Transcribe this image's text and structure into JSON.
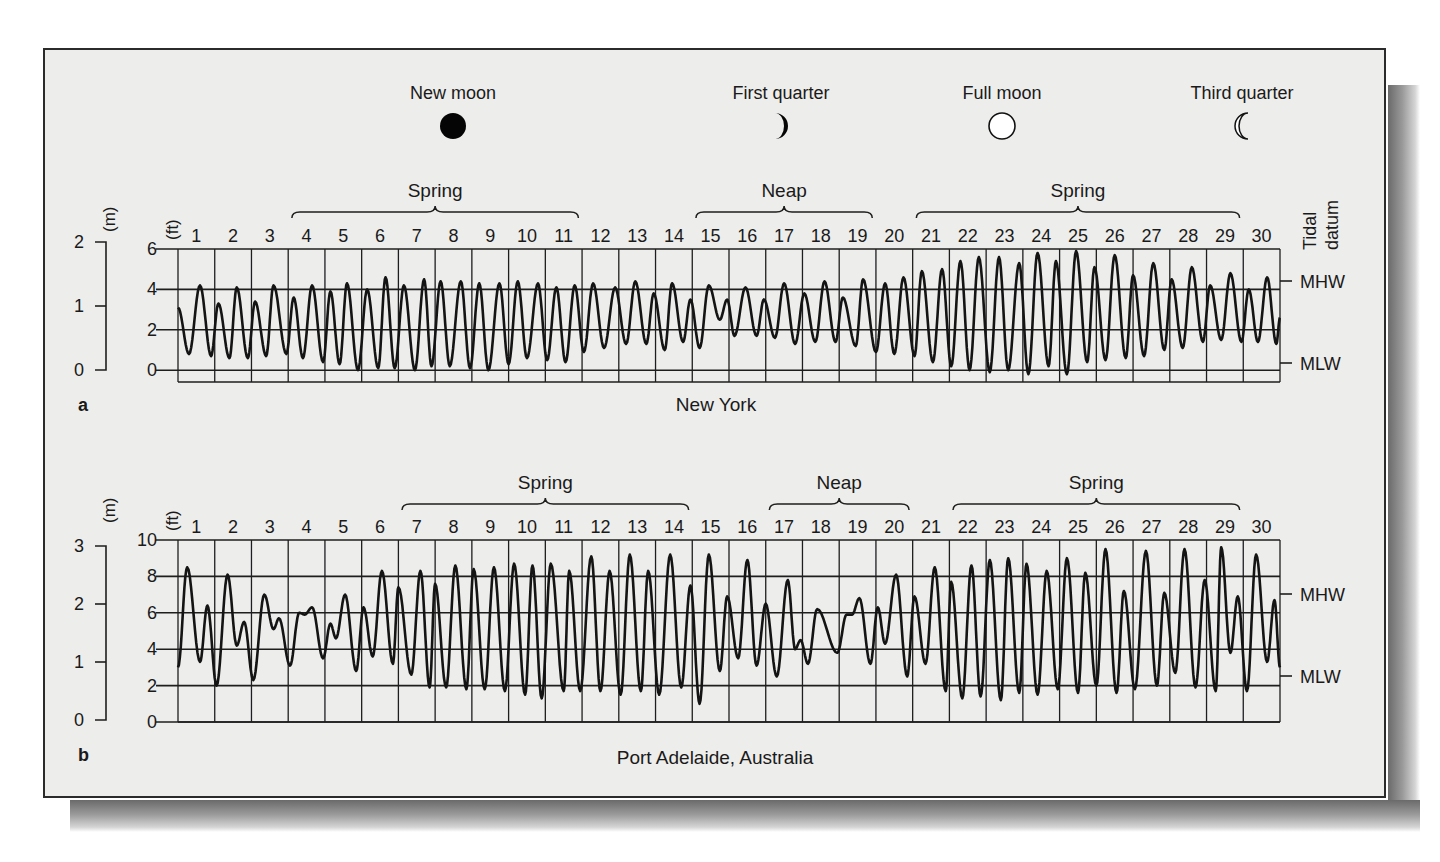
{
  "moon_phases": [
    {
      "label": "New moon",
      "icon": "new-moon-icon",
      "x": 453
    },
    {
      "label": "First quarter",
      "icon": "first-quarter-moon-icon",
      "x": 781
    },
    {
      "label": "Full moon",
      "icon": "full-moon-icon",
      "x": 1002
    },
    {
      "label": "Third quarter",
      "icon": "third-quarter-moon-icon",
      "x": 1242
    }
  ],
  "tidal_datum_label": [
    "Tidal",
    "datum"
  ],
  "chart_data": [
    {
      "type": "line",
      "panel_label": "a",
      "title": "New York",
      "xlabel": "Day of month",
      "ylabel_left_m": "(m)",
      "ylabel_left_ft": "(ft)",
      "x_ticks": [
        "1",
        "2",
        "3",
        "4",
        "5",
        "6",
        "7",
        "8",
        "9",
        "10",
        "11",
        "12",
        "13",
        "14",
        "15",
        "16",
        "17",
        "18",
        "19",
        "20",
        "21",
        "22",
        "23",
        "24",
        "25",
        "26",
        "27",
        "28",
        "29",
        "30"
      ],
      "y_ticks_ft": [
        0,
        2,
        4,
        6
      ],
      "y_ticks_m": [
        0,
        1,
        2
      ],
      "ylim_ft": [
        -0.6,
        6
      ],
      "grid": true,
      "datum_markers": [
        {
          "label": "MHW",
          "ft": 4.4
        },
        {
          "label": "MLW",
          "ft": 0.3
        }
      ],
      "periods": [
        {
          "label": "Spring",
          "from_day": 4,
          "to_day": 11
        },
        {
          "label": "Neap",
          "from_day": 15,
          "to_day": 19
        },
        {
          "label": "Spring",
          "from_day": 21,
          "to_day": 29
        }
      ],
      "series": [
        {
          "name": "Water level (ft)",
          "extremes": [
            [
              0.0,
              3.1
            ],
            [
              0.3,
              0.8
            ],
            [
              0.6,
              4.2
            ],
            [
              0.9,
              0.7
            ],
            [
              1.1,
              3.3
            ],
            [
              1.4,
              0.6
            ],
            [
              1.6,
              4.1
            ],
            [
              1.9,
              0.6
            ],
            [
              2.1,
              3.4
            ],
            [
              2.4,
              0.7
            ],
            [
              2.6,
              4.2
            ],
            [
              2.95,
              0.8
            ],
            [
              3.15,
              3.6
            ],
            [
              3.4,
              0.6
            ],
            [
              3.65,
              4.2
            ],
            [
              3.95,
              0.4
            ],
            [
              4.15,
              3.9
            ],
            [
              4.4,
              0.3
            ],
            [
              4.6,
              4.3
            ],
            [
              4.9,
              0.0
            ],
            [
              5.15,
              4.0
            ],
            [
              5.45,
              0.1
            ],
            [
              5.65,
              4.6
            ],
            [
              5.9,
              0.1
            ],
            [
              6.15,
              4.2
            ],
            [
              6.45,
              0.0
            ],
            [
              6.7,
              4.5
            ],
            [
              6.9,
              0.2
            ],
            [
              7.15,
              4.4
            ],
            [
              7.4,
              0.2
            ],
            [
              7.7,
              4.4
            ],
            [
              7.95,
              0.1
            ],
            [
              8.2,
              4.3
            ],
            [
              8.45,
              0.0
            ],
            [
              8.75,
              4.3
            ],
            [
              9.0,
              0.3
            ],
            [
              9.25,
              4.4
            ],
            [
              9.5,
              0.6
            ],
            [
              9.8,
              4.3
            ],
            [
              10.05,
              0.5
            ],
            [
              10.3,
              4.1
            ],
            [
              10.55,
              0.4
            ],
            [
              10.8,
              4.2
            ],
            [
              11.05,
              0.9
            ],
            [
              11.3,
              4.3
            ],
            [
              11.6,
              1.1
            ],
            [
              11.9,
              4.1
            ],
            [
              12.2,
              1.3
            ],
            [
              12.45,
              4.4
            ],
            [
              12.75,
              1.3
            ],
            [
              12.95,
              3.8
            ],
            [
              13.25,
              1.0
            ],
            [
              13.45,
              4.3
            ],
            [
              13.75,
              1.4
            ],
            [
              13.95,
              3.5
            ],
            [
              14.2,
              1.1
            ],
            [
              14.45,
              4.2
            ],
            [
              14.75,
              2.5
            ],
            [
              14.95,
              3.5
            ],
            [
              15.15,
              1.7
            ],
            [
              15.45,
              4.1
            ],
            [
              15.75,
              1.7
            ],
            [
              15.95,
              3.5
            ],
            [
              16.25,
              1.6
            ],
            [
              16.5,
              4.3
            ],
            [
              16.8,
              1.3
            ],
            [
              17.05,
              3.8
            ],
            [
              17.35,
              1.4
            ],
            [
              17.6,
              4.4
            ],
            [
              17.9,
              1.4
            ],
            [
              18.1,
              3.6
            ],
            [
              18.45,
              1.2
            ],
            [
              18.65,
              4.5
            ],
            [
              19.0,
              0.9
            ],
            [
              19.25,
              4.3
            ],
            [
              19.5,
              0.8
            ],
            [
              19.75,
              4.6
            ],
            [
              20.05,
              0.7
            ],
            [
              20.25,
              4.9
            ],
            [
              20.55,
              0.4
            ],
            [
              20.8,
              5.0
            ],
            [
              21.05,
              0.2
            ],
            [
              21.3,
              5.4
            ],
            [
              21.55,
              0.0
            ],
            [
              21.8,
              5.6
            ],
            [
              22.1,
              -0.1
            ],
            [
              22.35,
              5.6
            ],
            [
              22.6,
              0.0
            ],
            [
              22.9,
              5.3
            ],
            [
              23.15,
              -0.2
            ],
            [
              23.4,
              5.8
            ],
            [
              23.7,
              0.2
            ],
            [
              23.9,
              5.4
            ],
            [
              24.2,
              -0.2
            ],
            [
              24.45,
              5.9
            ],
            [
              24.75,
              0.4
            ],
            [
              24.95,
              5.1
            ],
            [
              25.25,
              0.5
            ],
            [
              25.5,
              5.7
            ],
            [
              25.8,
              0.6
            ],
            [
              26.0,
              4.7
            ],
            [
              26.3,
              0.7
            ],
            [
              26.55,
              5.3
            ],
            [
              26.85,
              1.0
            ],
            [
              27.05,
              4.5
            ],
            [
              27.35,
              1.1
            ],
            [
              27.6,
              5.1
            ],
            [
              27.9,
              1.4
            ],
            [
              28.1,
              4.2
            ],
            [
              28.4,
              1.5
            ],
            [
              28.65,
              4.8
            ],
            [
              28.95,
              1.4
            ],
            [
              29.15,
              4.0
            ],
            [
              29.4,
              1.4
            ],
            [
              29.65,
              4.6
            ],
            [
              29.9,
              1.3
            ],
            [
              30.0,
              2.6
            ]
          ]
        }
      ]
    },
    {
      "type": "line",
      "panel_label": "b",
      "title": "Port Adelaide, Australia",
      "xlabel": "Day of month",
      "ylabel_left_m": "(m)",
      "ylabel_left_ft": "(ft)",
      "x_ticks": [
        "1",
        "2",
        "3",
        "4",
        "5",
        "6",
        "7",
        "8",
        "9",
        "10",
        "11",
        "12",
        "13",
        "14",
        "15",
        "16",
        "17",
        "18",
        "19",
        "20",
        "21",
        "22",
        "23",
        "24",
        "25",
        "26",
        "27",
        "28",
        "29",
        "30"
      ],
      "y_ticks_ft": [
        0,
        2,
        4,
        6,
        8,
        10
      ],
      "y_ticks_m": [
        0,
        1,
        2,
        3
      ],
      "ylim_ft": [
        0,
        10
      ],
      "grid": true,
      "datum_markers": [
        {
          "label": "MHW",
          "ft": 7.0
        },
        {
          "label": "MLW",
          "ft": 2.6
        }
      ],
      "periods": [
        {
          "label": "Spring",
          "from_day": 7,
          "to_day": 14
        },
        {
          "label": "Neap",
          "from_day": 17,
          "to_day": 20
        },
        {
          "label": "Spring",
          "from_day": 22,
          "to_day": 29
        }
      ],
      "series": [
        {
          "name": "Water level (ft)",
          "extremes": [
            [
              0.0,
              3.0
            ],
            [
              0.25,
              8.5
            ],
            [
              0.6,
              3.3
            ],
            [
              0.8,
              6.4
            ],
            [
              1.05,
              2.0
            ],
            [
              1.35,
              8.1
            ],
            [
              1.6,
              4.2
            ],
            [
              1.8,
              5.5
            ],
            [
              2.05,
              2.3
            ],
            [
              2.35,
              7.0
            ],
            [
              2.6,
              5.1
            ],
            [
              2.75,
              5.7
            ],
            [
              3.05,
              3.1
            ],
            [
              3.3,
              6.0
            ],
            [
              3.45,
              5.9
            ],
            [
              3.65,
              6.3
            ],
            [
              3.95,
              3.5
            ],
            [
              4.15,
              5.4
            ],
            [
              4.3,
              4.6
            ],
            [
              4.55,
              7.0
            ],
            [
              4.85,
              2.8
            ],
            [
              5.05,
              6.3
            ],
            [
              5.3,
              3.6
            ],
            [
              5.55,
              8.3
            ],
            [
              5.85,
              3.2
            ],
            [
              6.0,
              7.4
            ],
            [
              6.35,
              2.6
            ],
            [
              6.6,
              8.3
            ],
            [
              6.85,
              1.9
            ],
            [
              7.0,
              7.6
            ],
            [
              7.3,
              1.9
            ],
            [
              7.55,
              8.6
            ],
            [
              7.85,
              1.8
            ],
            [
              8.05,
              8.4
            ],
            [
              8.35,
              1.8
            ],
            [
              8.6,
              8.5
            ],
            [
              8.9,
              1.7
            ],
            [
              9.15,
              8.7
            ],
            [
              9.45,
              1.5
            ],
            [
              9.65,
              8.6
            ],
            [
              9.9,
              1.3
            ],
            [
              10.15,
              8.7
            ],
            [
              10.5,
              1.7
            ],
            [
              10.65,
              8.3
            ],
            [
              10.95,
              1.7
            ],
            [
              11.25,
              9.1
            ],
            [
              11.5,
              1.7
            ],
            [
              11.75,
              8.3
            ],
            [
              12.05,
              1.5
            ],
            [
              12.3,
              9.2
            ],
            [
              12.6,
              1.7
            ],
            [
              12.8,
              8.3
            ],
            [
              13.1,
              1.5
            ],
            [
              13.4,
              9.2
            ],
            [
              13.7,
              1.9
            ],
            [
              13.95,
              7.5
            ],
            [
              14.2,
              1.0
            ],
            [
              14.45,
              9.2
            ],
            [
              14.75,
              2.8
            ],
            [
              14.95,
              6.9
            ],
            [
              15.25,
              3.5
            ],
            [
              15.5,
              8.9
            ],
            [
              15.75,
              3.1
            ],
            [
              16.0,
              6.5
            ],
            [
              16.3,
              2.5
            ],
            [
              16.6,
              7.8
            ],
            [
              16.8,
              4.0
            ],
            [
              16.95,
              4.5
            ],
            [
              17.15,
              3.2
            ],
            [
              17.4,
              6.2
            ],
            [
              17.95,
              3.8
            ],
            [
              18.2,
              5.9
            ],
            [
              18.35,
              5.9
            ],
            [
              18.55,
              6.8
            ],
            [
              18.85,
              3.2
            ],
            [
              19.05,
              6.3
            ],
            [
              19.25,
              4.3
            ],
            [
              19.55,
              8.1
            ],
            [
              19.85,
              2.5
            ],
            [
              20.05,
              6.9
            ],
            [
              20.35,
              3.2
            ],
            [
              20.6,
              8.5
            ],
            [
              20.9,
              1.7
            ],
            [
              21.05,
              7.7
            ],
            [
              21.35,
              1.3
            ],
            [
              21.6,
              8.6
            ],
            [
              21.85,
              1.4
            ],
            [
              22.1,
              8.9
            ],
            [
              22.4,
              1.2
            ],
            [
              22.6,
              9.0
            ],
            [
              22.9,
              1.6
            ],
            [
              23.1,
              8.7
            ],
            [
              23.4,
              1.5
            ],
            [
              23.65,
              8.3
            ],
            [
              23.95,
              1.8
            ],
            [
              24.2,
              9.0
            ],
            [
              24.5,
              1.6
            ],
            [
              24.7,
              8.2
            ],
            [
              25.0,
              2.0
            ],
            [
              25.25,
              9.5
            ],
            [
              25.55,
              1.6
            ],
            [
              25.75,
              7.2
            ],
            [
              26.05,
              1.8
            ],
            [
              26.35,
              9.4
            ],
            [
              26.65,
              2.0
            ],
            [
              26.85,
              7.1
            ],
            [
              27.15,
              2.7
            ],
            [
              27.4,
              9.5
            ],
            [
              27.7,
              1.9
            ],
            [
              27.95,
              7.8
            ],
            [
              28.25,
              1.7
            ],
            [
              28.4,
              9.6
            ],
            [
              28.65,
              3.8
            ],
            [
              28.85,
              6.9
            ],
            [
              29.1,
              1.7
            ],
            [
              29.35,
              9.2
            ],
            [
              29.65,
              3.3
            ],
            [
              29.85,
              6.7
            ],
            [
              30.0,
              3.0
            ]
          ]
        }
      ]
    }
  ]
}
